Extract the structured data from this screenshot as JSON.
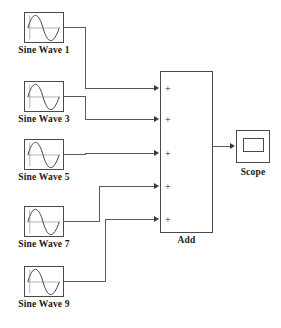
{
  "diagram": {
    "type": "block-diagram",
    "background_color": "#ffffff",
    "line_color": "#5a5a5a",
    "text_color": "#1a1a1a"
  },
  "sources": [
    {
      "label": "Sine Wave  1",
      "icon": "sine-wave-icon",
      "x": 24,
      "y": 12,
      "out_y": 27
    },
    {
      "label": "Sine Wave  3",
      "icon": "sine-wave-icon",
      "x": 24,
      "y": 81,
      "out_y": 96
    },
    {
      "label": "Sine Wave  5",
      "icon": "sine-wave-icon",
      "x": 24,
      "y": 139,
      "out_y": 154
    },
    {
      "label": "Sine Wave  7",
      "icon": "sine-wave-icon",
      "x": 24,
      "y": 206,
      "out_y": 221
    },
    {
      "label": "Sine Wave  9",
      "icon": "sine-wave-icon",
      "x": 24,
      "y": 266,
      "out_y": 281
    }
  ],
  "adder": {
    "label": "Add",
    "x": 160,
    "y": 71,
    "width": 53,
    "height": 162,
    "ports": [
      {
        "sign": "+",
        "y": 88
      },
      {
        "sign": "+",
        "y": 119
      },
      {
        "sign": "+",
        "y": 153
      },
      {
        "sign": "+",
        "y": 186
      },
      {
        "sign": "+",
        "y": 219
      }
    ],
    "output_y": 152
  },
  "scope": {
    "label": "Scope",
    "icon": "scope-icon",
    "x": 236,
    "y": 130,
    "input_y": 146
  },
  "wires": [
    {
      "name": "wire-sine1-to-add",
      "from": "Sine Wave  1",
      "to": "Add port 1"
    },
    {
      "name": "wire-sine3-to-add",
      "from": "Sine Wave  3",
      "to": "Add port 2"
    },
    {
      "name": "wire-sine5-to-add",
      "from": "Sine Wave  5",
      "to": "Add port 3"
    },
    {
      "name": "wire-sine7-to-add",
      "from": "Sine Wave  7",
      "to": "Add port 4"
    },
    {
      "name": "wire-sine9-to-add",
      "from": "Sine Wave  9",
      "to": "Add port 5"
    },
    {
      "name": "wire-add-to-scope",
      "from": "Add",
      "to": "Scope"
    }
  ]
}
